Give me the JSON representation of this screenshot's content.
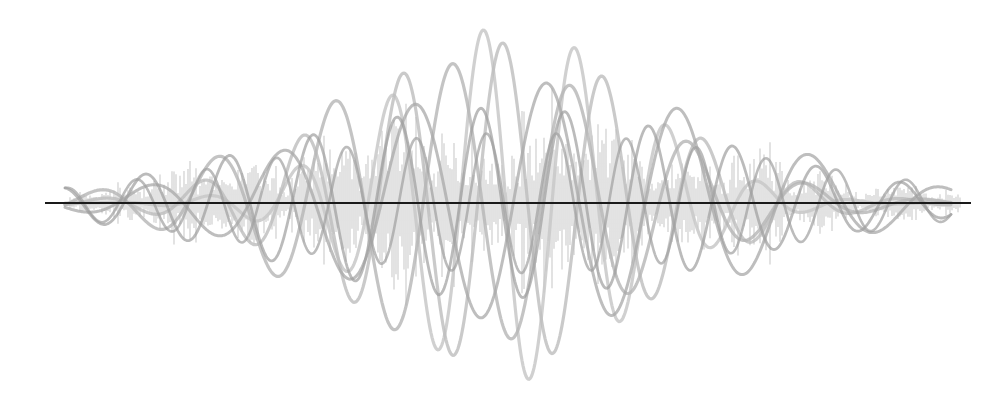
{
  "illustration": {
    "kind": "overlapping-waveforms",
    "background": "#ffffff",
    "baseline": {
      "x1": 45,
      "x2": 971,
      "y": 203,
      "color": "#1a1a1a",
      "width": 2
    },
    "center_y": 203,
    "waves": [
      {
        "amp": 178,
        "period": 92,
        "phase": 0.0,
        "center_x": 512,
        "sigma": 120,
        "color": "#c8c8c8",
        "width": 3.2,
        "opacity": 0.85
      },
      {
        "amp": 160,
        "period": 100,
        "phase": 1.4,
        "center_x": 500,
        "sigma": 150,
        "color": "#bdbdbd",
        "width": 3.2,
        "opacity": 0.8
      },
      {
        "amp": 140,
        "period": 118,
        "phase": 2.6,
        "center_x": 470,
        "sigma": 170,
        "color": "#b5b5b5",
        "width": 3.2,
        "opacity": 0.8
      },
      {
        "amp": 120,
        "period": 132,
        "phase": 0.7,
        "center_x": 540,
        "sigma": 200,
        "color": "#a8a8a8",
        "width": 3.0,
        "opacity": 0.75
      },
      {
        "amp": 95,
        "period": 84,
        "phase": 3.3,
        "center_x": 500,
        "sigma": 230,
        "color": "#9e9e9e",
        "width": 2.8,
        "opacity": 0.7
      },
      {
        "amp": 70,
        "period": 70,
        "phase": 1.9,
        "center_x": 520,
        "sigma": 260,
        "color": "#a0a0a0",
        "width": 2.6,
        "opacity": 0.7
      }
    ],
    "noise": {
      "color": "#cfcfcf",
      "opacity": 0.85,
      "x_start": 70,
      "x_end": 960,
      "step": 2,
      "max_amp": 130,
      "center_x": 505,
      "sigma": 230,
      "seed": 7
    }
  }
}
